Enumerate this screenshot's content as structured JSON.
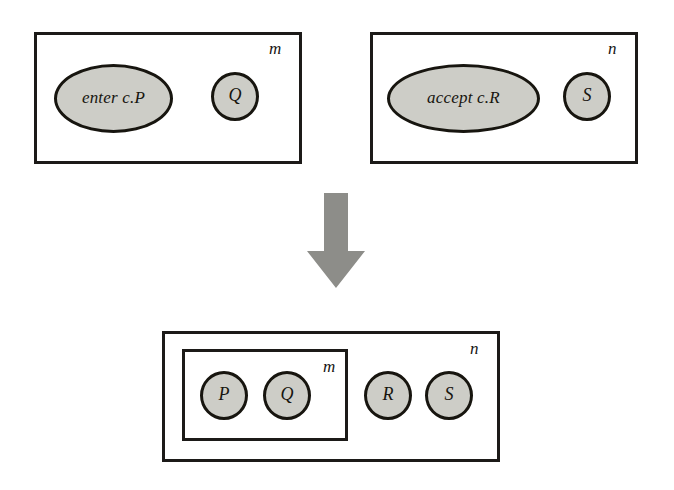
{
  "diagram": {
    "colors": {
      "node_fill": "#cdcdc7",
      "outline": "#17150f",
      "arrow": "#8d8d89",
      "background": "#ffffff"
    },
    "before": {
      "left_box": {
        "label": "m",
        "nodes": [
          {
            "id": "enter",
            "label": "enter c.P",
            "shape": "ellipse"
          },
          {
            "id": "q",
            "label": "Q",
            "shape": "circle"
          }
        ]
      },
      "right_box": {
        "label": "n",
        "nodes": [
          {
            "id": "accept",
            "label": "accept c.R",
            "shape": "ellipse"
          },
          {
            "id": "s",
            "label": "S",
            "shape": "circle"
          }
        ]
      }
    },
    "transform": {
      "icon": "down-arrow-icon",
      "direction": "down"
    },
    "after": {
      "outer_box": {
        "label": "n",
        "nodes": [
          {
            "id": "r",
            "label": "R",
            "shape": "circle"
          },
          {
            "id": "s",
            "label": "S",
            "shape": "circle"
          }
        ]
      },
      "inner_box": {
        "label": "m",
        "nodes": [
          {
            "id": "p",
            "label": "P",
            "shape": "circle"
          },
          {
            "id": "q",
            "label": "Q",
            "shape": "circle"
          }
        ]
      }
    }
  }
}
